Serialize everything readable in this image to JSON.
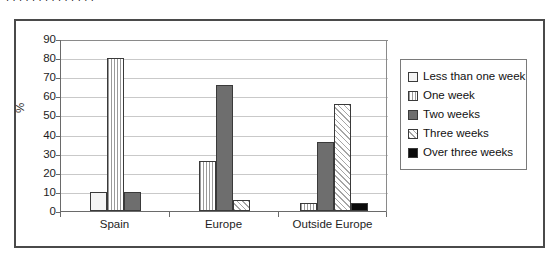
{
  "ghost_caption": "ı ı ı   ı   ı     ı        ı   ı ı ı ı     ı    ı ı",
  "chart_data": {
    "type": "bar",
    "title": "",
    "xlabel": "",
    "ylabel": "%",
    "ylim": [
      0,
      90
    ],
    "ytick_step": 10,
    "yticks": [
      0,
      10,
      20,
      30,
      40,
      50,
      60,
      70,
      80,
      90
    ],
    "grid": true,
    "legend_position": "right",
    "categories": [
      "Spain",
      "Europe",
      "Outside Europe"
    ],
    "series": [
      {
        "name": "Less than one week",
        "fill": "fill-empty",
        "values": [
          10,
          0,
          0
        ]
      },
      {
        "name": "One week",
        "fill": "fill-vlines",
        "values": [
          80,
          26,
          4
        ]
      },
      {
        "name": "Two weeks",
        "fill": "fill-solid-gray",
        "values": [
          10,
          66,
          36
        ]
      },
      {
        "name": "Three weeks",
        "fill": "fill-diagonal",
        "values": [
          0,
          6,
          56
        ]
      },
      {
        "name": "Over three weeks",
        "fill": "fill-black",
        "values": [
          0,
          0,
          4
        ]
      }
    ]
  },
  "colors": {
    "frame_border": "#4a4a4a",
    "axis": "#6a6a6a",
    "gridline": "#c9c9c9",
    "bar_outline": "#3a3a3a",
    "solid_gray": "#6e6e6e",
    "black": "#0a0a0a",
    "text": "#1d1d1d",
    "background": "#ffffff"
  }
}
